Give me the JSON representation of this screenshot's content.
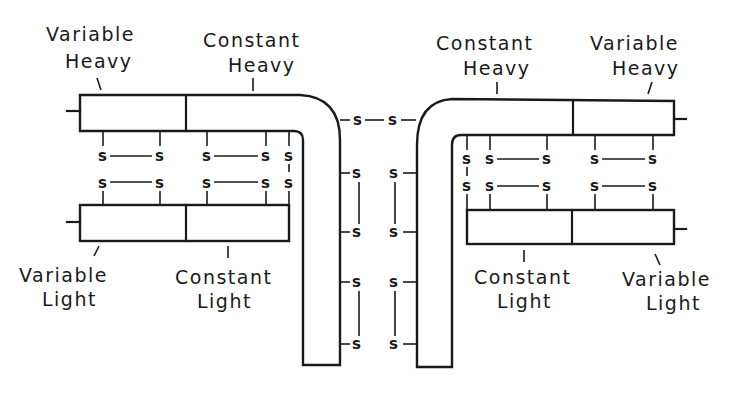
{
  "diagram": {
    "colors": {
      "line": "#1a1a1a",
      "background": "#ffffff"
    },
    "disulfide_symbol": "s",
    "left_unit": {
      "variable_heavy": {
        "line1": "Variable",
        "line2": "Heavy"
      },
      "constant_heavy": {
        "line1": "Constant",
        "line2": "Heavy"
      },
      "variable_light": {
        "line1": "Variable",
        "line2": "Light"
      },
      "constant_light": {
        "line1": "Constant",
        "line2": "Light"
      }
    },
    "right_unit": {
      "constant_heavy": {
        "line1": "Constant",
        "line2": "Heavy"
      },
      "variable_heavy": {
        "line1": "Variable",
        "line2": "Heavy"
      },
      "constant_light": {
        "line1": "Constant",
        "line2": "Light"
      },
      "variable_light": {
        "line1": "Variable",
        "line2": "Light"
      }
    }
  }
}
